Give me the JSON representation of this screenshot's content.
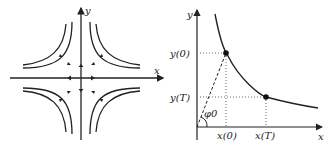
{
  "left_diagram": {
    "title": "saddle phase portrait",
    "x_label": "x",
    "y_label": "y"
  },
  "right_diagram": {
    "title": "hyperbola trajectory",
    "x_label": "x",
    "y_label": "y",
    "y0_label": "y(0)",
    "yT_label": "y(T)",
    "x0_label": "x(0)",
    "xT_label": "x(T)",
    "angle_label": "φ0"
  },
  "colors": {
    "stroke": "#222222",
    "dotted": "#555555"
  }
}
